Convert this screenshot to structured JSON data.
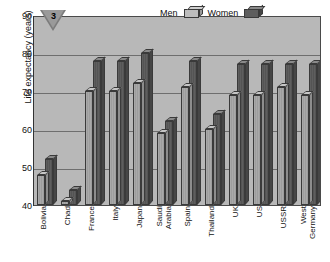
{
  "marker": {
    "number": "3",
    "icon": "triangle-down-icon"
  },
  "legend": {
    "position": "top-right",
    "entries": [
      {
        "label": "Men",
        "color": "#bdbdbd"
      },
      {
        "label": "Women",
        "color": "#5e5e5e"
      }
    ]
  },
  "axes": {
    "ylabel": "Life expectancy (years)",
    "xlabel": "",
    "yticks": [
      "90",
      "80",
      "70",
      "60",
      "50",
      "40"
    ],
    "ylim": [
      40,
      90
    ]
  },
  "chart_data": {
    "type": "bar",
    "title": "",
    "xlabel": "",
    "ylabel": "Life expectancy (years)",
    "ylim": [
      40,
      90
    ],
    "grid": true,
    "legend_position": "top-right",
    "categories": [
      "Bolivia",
      "Chad",
      "France",
      "Italy",
      "Japan",
      "Saudi Arabia",
      "Spain",
      "Thailand",
      "UK",
      "US",
      "USSR",
      "West Germany"
    ],
    "category_lines": [
      [
        "Bolivia"
      ],
      [
        "Chad"
      ],
      [
        "France"
      ],
      [
        "Italy"
      ],
      [
        "Japan"
      ],
      [
        "Saudi",
        "Arabia"
      ],
      [
        "Spain"
      ],
      [
        "Thailand"
      ],
      [
        "UK"
      ],
      [
        "US"
      ],
      [
        "USSR"
      ],
      [
        "West",
        "Germany"
      ]
    ],
    "series": [
      {
        "name": "Men",
        "color": "#bdbdbd",
        "values": [
          48,
          41,
          70,
          70,
          72,
          59,
          71,
          60,
          69,
          69,
          71,
          69
        ]
      },
      {
        "name": "Women",
        "color": "#5e5e5e",
        "values": [
          52,
          44,
          78,
          78,
          80,
          62,
          78,
          64,
          77,
          77,
          77,
          77
        ]
      }
    ]
  }
}
